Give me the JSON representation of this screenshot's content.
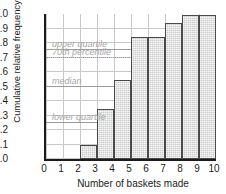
{
  "chart_data": {
    "type": "bar",
    "title": "",
    "xlabel": "Number of baskets made",
    "ylabel": "Cumulative relative frequency",
    "categories": [
      "0",
      "1",
      "2",
      "3",
      "4",
      "5",
      "6",
      "7",
      "8",
      "9",
      "10"
    ],
    "values": [
      0,
      0,
      0,
      0.1,
      0.345,
      0.545,
      0.84,
      0.84,
      0.935,
      0.99,
      0.99
    ],
    "xlim": [
      0,
      10
    ],
    "ylim": [
      0,
      1.0
    ],
    "grid": true,
    "legend": "none",
    "xticks": [
      "0",
      "1",
      "2",
      "3",
      "4",
      "5",
      "6",
      "7",
      "8",
      "9",
      "10"
    ],
    "yticks": [
      "0.0",
      "0.1",
      "0.2",
      "0.3",
      "0.4",
      "0.5",
      "0.6",
      "0.7",
      "0.8",
      "0.9",
      "1.0"
    ],
    "ytick_values": [
      0.0,
      0.1,
      0.2,
      0.3,
      0.4,
      0.5,
      0.6,
      0.7,
      0.8,
      0.9,
      1.0
    ],
    "annotations": [
      {
        "label": "upper quartile",
        "value": 0.75,
        "style": "solid"
      },
      {
        "label": "70th percentile",
        "value": 0.7,
        "style": "dotted"
      },
      {
        "label": "median",
        "value": 0.5,
        "style": "solid"
      },
      {
        "label": "lower quartile",
        "value": 0.25,
        "style": "solid"
      }
    ],
    "colors": {
      "bar_fill": "#cdcdcd",
      "bar_edge": "#4a4a4a",
      "grid": "#c8c8c8",
      "axis": "#1b1b1b",
      "annotation": "#a6a6a6"
    }
  }
}
